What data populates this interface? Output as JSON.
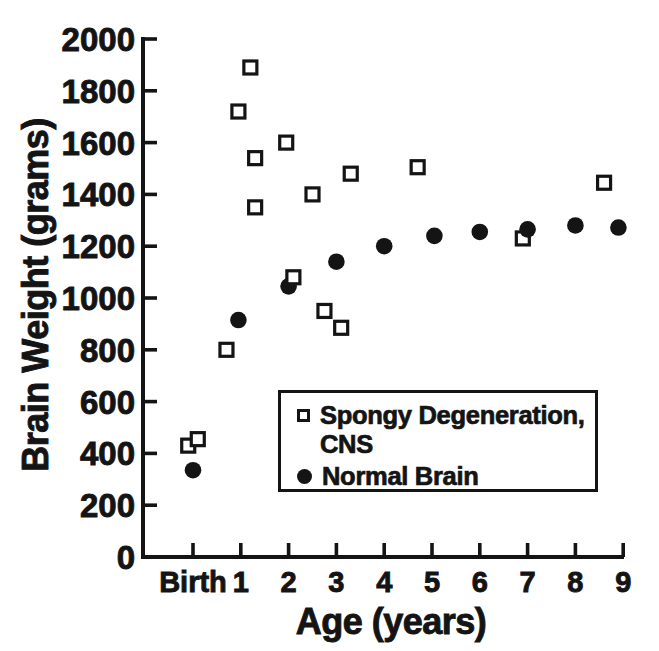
{
  "figure": {
    "background": "#ffffff",
    "ink_color": "#141414"
  },
  "chart_data": {
    "type": "scatter",
    "title": "",
    "xlabel": "Age (years)",
    "ylabel": "Brain Weight (grams)",
    "x_tick_labels": [
      "Birth",
      "1",
      "2",
      "3",
      "4",
      "5",
      "6",
      "7",
      "8",
      "9"
    ],
    "x_tick_values": [
      0,
      1,
      2,
      3,
      4,
      5,
      6,
      7,
      8,
      9
    ],
    "y_ticks": [
      0,
      200,
      400,
      600,
      800,
      1000,
      1200,
      1400,
      1600,
      1800,
      2000
    ],
    "xlim": [
      -0.6,
      9.1
    ],
    "ylim": [
      0,
      2000
    ],
    "grid": false,
    "legend_position": "inside-middle-right",
    "series": [
      {
        "name": "Spongy Degeneration, CNS",
        "marker": "open-square",
        "points": [
          {
            "x": -0.1,
            "y": 430
          },
          {
            "x": 0.1,
            "y": 455
          },
          {
            "x": 0.7,
            "y": 800
          },
          {
            "x": 0.95,
            "y": 1720
          },
          {
            "x": 1.2,
            "y": 1890
          },
          {
            "x": 1.3,
            "y": 1540
          },
          {
            "x": 1.3,
            "y": 1350
          },
          {
            "x": 1.95,
            "y": 1600
          },
          {
            "x": 2.1,
            "y": 1080,
            "layer": "front"
          },
          {
            "x": 2.5,
            "y": 1400
          },
          {
            "x": 2.75,
            "y": 950
          },
          {
            "x": 3.1,
            "y": 885
          },
          {
            "x": 3.3,
            "y": 1480
          },
          {
            "x": 4.7,
            "y": 1505
          },
          {
            "x": 6.9,
            "y": 1230
          },
          {
            "x": 8.6,
            "y": 1445
          }
        ]
      },
      {
        "name": "Normal Brain",
        "marker": "filled-circle",
        "points": [
          {
            "x": 0,
            "y": 335
          },
          {
            "x": 0.95,
            "y": 915
          },
          {
            "x": 2,
            "y": 1045
          },
          {
            "x": 3,
            "y": 1140
          },
          {
            "x": 4,
            "y": 1200
          },
          {
            "x": 5.05,
            "y": 1240
          },
          {
            "x": 6,
            "y": 1255
          },
          {
            "x": 7,
            "y": 1265
          },
          {
            "x": 8,
            "y": 1280
          },
          {
            "x": 8.9,
            "y": 1272
          }
        ]
      }
    ]
  },
  "legend": {
    "items": [
      {
        "marker": "open-square",
        "lines": [
          "Spongy Degeneration,",
          "CNS"
        ]
      },
      {
        "marker": "filled-circle",
        "lines": [
          "Normal Brain"
        ]
      }
    ]
  }
}
